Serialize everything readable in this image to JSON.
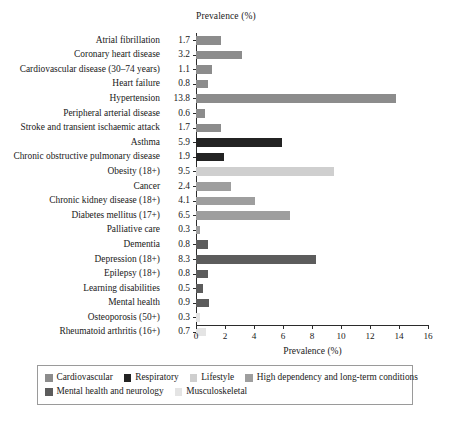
{
  "chart": {
    "type": "bar",
    "orientation": "horizontal",
    "top_axis_title": "Prevalence (%)",
    "bottom_axis_title": "Prevalence (%)"
  },
  "chart_data": {
    "type": "bar",
    "title": "",
    "subtitle": "",
    "xlabel": "Prevalence (%)",
    "ylabel": "",
    "xlim": [
      0,
      16
    ],
    "xticks": [
      0,
      2,
      4,
      6,
      8,
      10,
      12,
      14,
      16
    ],
    "grid": false,
    "legend_position": "bottom",
    "orientation": "horizontal",
    "top_axis_label": "Prevalence (%)",
    "categories": [
      "Atrial fibrillation",
      "Coronary heart disease",
      "Cardiovascular disease (30–74 years)",
      "Heart failure",
      "Hypertension",
      "Peripheral arterial disease",
      "Stroke and transient ischaemic attack",
      "Asthma",
      "Chronic obstructive pulmonary disease",
      "Obesity (18+)",
      "Cancer",
      "Chronic kidney disease (18+)",
      "Diabetes mellitus (17+)",
      "Palliative care",
      "Dementia",
      "Depression (18+)",
      "Epilepsy (18+)",
      "Learning disabilities",
      "Mental health",
      "Osteoporosis (50+)",
      "Rheumatoid arthritis (16+)"
    ],
    "values": [
      1.7,
      3.2,
      1.1,
      0.8,
      13.8,
      0.6,
      1.7,
      5.9,
      1.9,
      9.5,
      2.4,
      4.1,
      6.5,
      0.3,
      0.8,
      8.3,
      0.8,
      0.5,
      0.9,
      0.3,
      0.7
    ],
    "group_of_category": [
      "Cardiovascular",
      "Cardiovascular",
      "Cardiovascular",
      "Cardiovascular",
      "Cardiovascular",
      "Cardiovascular",
      "Cardiovascular",
      "Respiratory",
      "Respiratory",
      "Lifestyle",
      "High dependency and long-term conditions",
      "High dependency and long-term conditions",
      "High dependency and long-term conditions",
      "High dependency and long-term conditions",
      "Mental health and neurology",
      "Mental health and neurology",
      "Mental health and neurology",
      "Mental health and neurology",
      "Mental health and neurology",
      "Musculoskeletal",
      "Musculoskeletal"
    ],
    "series": [
      {
        "name": "Cardiovascular",
        "color": "#8c8c8c",
        "points": [
          {
            "category": "Atrial fibrillation",
            "value": 1.7
          },
          {
            "category": "Coronary heart disease",
            "value": 3.2
          },
          {
            "category": "Cardiovascular disease (30–74 years)",
            "value": 1.1
          },
          {
            "category": "Heart failure",
            "value": 0.8
          },
          {
            "category": "Hypertension",
            "value": 13.8
          },
          {
            "category": "Peripheral arterial disease",
            "value": 0.6
          },
          {
            "category": "Stroke and transient ischaemic attack",
            "value": 1.7
          }
        ]
      },
      {
        "name": "Respiratory",
        "color": "#232323",
        "points": [
          {
            "category": "Asthma",
            "value": 5.9
          },
          {
            "category": "Chronic obstructive pulmonary disease",
            "value": 1.9
          }
        ]
      },
      {
        "name": "Lifestyle",
        "color": "#cfcfcf",
        "points": [
          {
            "category": "Obesity (18+)",
            "value": 9.5
          }
        ]
      },
      {
        "name": "High dependency and long-term conditions",
        "color": "#9e9e9e",
        "points": [
          {
            "category": "Cancer",
            "value": 2.4
          },
          {
            "category": "Chronic kidney disease (18+)",
            "value": 4.1
          },
          {
            "category": "Diabetes mellitus (17+)",
            "value": 6.5
          },
          {
            "category": "Palliative care",
            "value": 0.3
          }
        ]
      },
      {
        "name": "Mental health and neurology",
        "color": "#5c5c5c",
        "points": [
          {
            "category": "Dementia",
            "value": 0.8
          },
          {
            "category": "Depression (18+)",
            "value": 8.3
          },
          {
            "category": "Epilepsy (18+)",
            "value": 0.8
          },
          {
            "category": "Learning disabilities",
            "value": 0.5
          },
          {
            "category": "Mental health",
            "value": 0.9
          }
        ]
      },
      {
        "name": "Musculoskeletal",
        "color": "#e4e4e4",
        "points": [
          {
            "category": "Osteoporosis (50+)",
            "value": 0.3
          },
          {
            "category": "Rheumatoid arthritis (16+)",
            "value": 0.7
          }
        ]
      }
    ]
  },
  "legend": {
    "rows": [
      [
        {
          "label": "Cardiovascular",
          "color": "#8c8c8c"
        },
        {
          "label": "Respiratory",
          "color": "#232323"
        },
        {
          "label": "Lifestyle",
          "color": "#cfcfcf"
        },
        {
          "label": "High dependency and long-term conditions",
          "color": "#9e9e9e"
        }
      ],
      [
        {
          "label": "Mental health and neurology",
          "color": "#5c5c5c"
        },
        {
          "label": "Musculoskeletal",
          "color": "#e4e4e4"
        }
      ]
    ]
  }
}
